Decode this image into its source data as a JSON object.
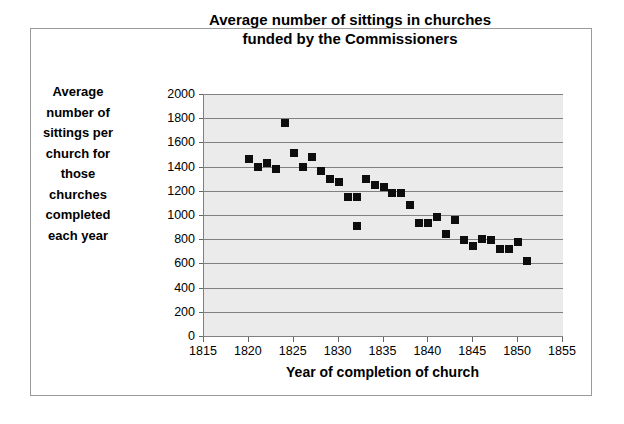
{
  "chart_data": {
    "type": "scatter",
    "title": "Average number of sittings in churches funded by the Commissioners",
    "title_lines": [
      "Average number of sittings in churches",
      "funded by the Commissioners"
    ],
    "xlabel": "Year of completion of church",
    "ylabel": "Average number of sittings per church for those churches completed each year",
    "ylabel_lines": [
      "Average",
      "number of",
      "sittings per",
      "church for",
      "those",
      "churches",
      "completed",
      "each year"
    ],
    "xlim": [
      1815,
      1855
    ],
    "ylim": [
      0,
      2000
    ],
    "xticks": [
      1815,
      1820,
      1825,
      1830,
      1835,
      1840,
      1845,
      1850,
      1855
    ],
    "yticks": [
      0,
      200,
      400,
      600,
      800,
      1000,
      1200,
      1400,
      1600,
      1800,
      2000
    ],
    "grid": "horizontal",
    "legend": "none",
    "marker": "filled-square",
    "marker_color": "#0d0d0d",
    "plot_background": "#ebebeb",
    "gridline_color": "#808080",
    "axis_color": "#808080",
    "frame_color": "#9a9a9a",
    "points": [
      {
        "x": 1820,
        "y": 1460
      },
      {
        "x": 1821,
        "y": 1400
      },
      {
        "x": 1822,
        "y": 1430
      },
      {
        "x": 1823,
        "y": 1380
      },
      {
        "x": 1824,
        "y": 1760
      },
      {
        "x": 1825,
        "y": 1510
      },
      {
        "x": 1826,
        "y": 1400
      },
      {
        "x": 1827,
        "y": 1480
      },
      {
        "x": 1828,
        "y": 1360
      },
      {
        "x": 1829,
        "y": 1300
      },
      {
        "x": 1830,
        "y": 1270
      },
      {
        "x": 1831,
        "y": 1150
      },
      {
        "x": 1832,
        "y": 1150
      },
      {
        "x": 1832,
        "y": 910
      },
      {
        "x": 1833,
        "y": 1300
      },
      {
        "x": 1834,
        "y": 1250
      },
      {
        "x": 1835,
        "y": 1230
      },
      {
        "x": 1836,
        "y": 1180
      },
      {
        "x": 1837,
        "y": 1180
      },
      {
        "x": 1838,
        "y": 1080
      },
      {
        "x": 1839,
        "y": 930
      },
      {
        "x": 1840,
        "y": 935
      },
      {
        "x": 1841,
        "y": 985
      },
      {
        "x": 1842,
        "y": 840
      },
      {
        "x": 1843,
        "y": 955
      },
      {
        "x": 1844,
        "y": 790
      },
      {
        "x": 1845,
        "y": 745
      },
      {
        "x": 1846,
        "y": 800
      },
      {
        "x": 1847,
        "y": 790
      },
      {
        "x": 1848,
        "y": 720
      },
      {
        "x": 1849,
        "y": 720
      },
      {
        "x": 1850,
        "y": 775
      },
      {
        "x": 1851,
        "y": 620
      }
    ]
  }
}
